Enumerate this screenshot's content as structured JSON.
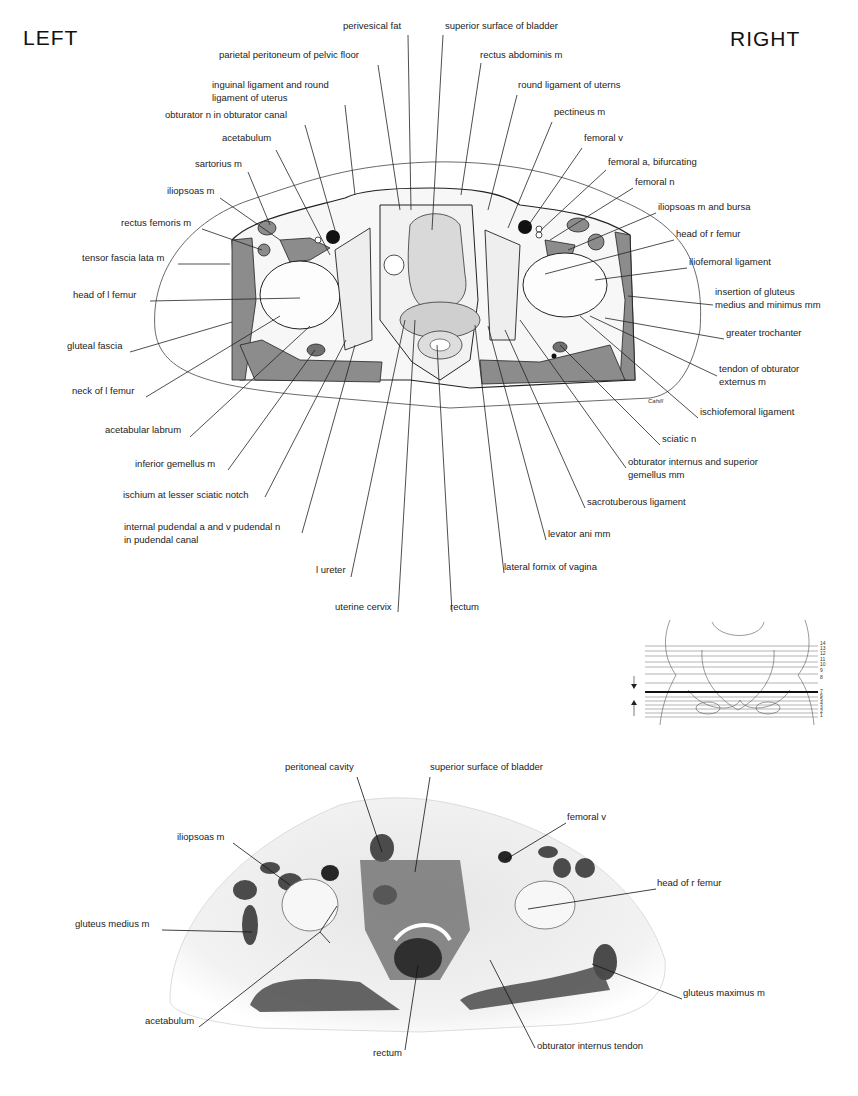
{
  "orientation": {
    "left": "LEFT",
    "right": "RIGHT"
  },
  "drawing": {
    "signature": "Cahill",
    "labels": [
      {
        "id": "perivesical-fat",
        "text": "perivesical fat",
        "x": 343,
        "y": 27
      },
      {
        "id": "superior-surface-bladder",
        "text": "superior surface of bladder",
        "x": 445,
        "y": 27
      },
      {
        "id": "parietal-peritoneum",
        "text": "parietal peritoneum of pelvic floor",
        "x": 219,
        "y": 56
      },
      {
        "id": "rectus-abdominis",
        "text": "rectus abdominis m",
        "x": 480,
        "y": 56
      },
      {
        "id": "inguinal-ligament",
        "text": "inguinal ligament and round\nligament of uterus",
        "x": 212,
        "y": 86
      },
      {
        "id": "round-ligament",
        "text": "round ligament of uterns",
        "x": 518,
        "y": 86
      },
      {
        "id": "obturator-n",
        "text": "obturator n in obturator canal",
        "x": 165,
        "y": 116
      },
      {
        "id": "pectineus",
        "text": "pectineus m",
        "x": 554,
        "y": 113
      },
      {
        "id": "acetabulum-top",
        "text": "acetabulum",
        "x": 222,
        "y": 139
      },
      {
        "id": "femoral-v-top",
        "text": "femoral v",
        "x": 584,
        "y": 139
      },
      {
        "id": "sartorius",
        "text": "sartorius m",
        "x": 195,
        "y": 165
      },
      {
        "id": "femoral-a",
        "text": "femoral a, bifurcating",
        "x": 608,
        "y": 163
      },
      {
        "id": "iliopsoas-left",
        "text": "iliopsoas m",
        "x": 167,
        "y": 192
      },
      {
        "id": "femoral-n",
        "text": "femoral n",
        "x": 635,
        "y": 183
      },
      {
        "id": "iliopsoas-bursa",
        "text": "iliopsoas m and bursa",
        "x": 658,
        "y": 208
      },
      {
        "id": "rectus-femoris",
        "text": "rectus femoris m",
        "x": 121,
        "y": 224
      },
      {
        "id": "head-r-femur-top",
        "text": "head of r femur",
        "x": 676,
        "y": 235
      },
      {
        "id": "tensor-fascia-lata",
        "text": "tensor fascia lata m",
        "x": 82,
        "y": 259
      },
      {
        "id": "iliofemoral-ligament",
        "text": "iliofemoral ligament",
        "x": 689,
        "y": 263
      },
      {
        "id": "head-l-femur",
        "text": "head of l femur",
        "x": 73,
        "y": 296
      },
      {
        "id": "insertion-gluteus",
        "text": "insertion of gluteus\nmedius and minimus mm",
        "x": 715,
        "y": 293
      },
      {
        "id": "greater-trochanter",
        "text": "greater trochanter",
        "x": 726,
        "y": 334
      },
      {
        "id": "gluteal-fascia",
        "text": "gluteal fascia",
        "x": 67,
        "y": 347
      },
      {
        "id": "tendon-obturator-externus",
        "text": "tendon of obturator\nexternus m",
        "x": 719,
        "y": 370
      },
      {
        "id": "neck-l-femur",
        "text": "neck of l femur",
        "x": 72,
        "y": 392
      },
      {
        "id": "ischiofemoral-ligament",
        "text": "ischiofemoral ligament",
        "x": 700,
        "y": 413
      },
      {
        "id": "acetabular-labrum",
        "text": "acetabular labrum",
        "x": 105,
        "y": 431
      },
      {
        "id": "sciatic-n",
        "text": "sciatic n",
        "x": 662,
        "y": 440
      },
      {
        "id": "inferior-gemellus",
        "text": "inferior gemellus m",
        "x": 135,
        "y": 465
      },
      {
        "id": "obturator-internus-superior-gemellus",
        "text": "obturator internus and superior\ngemellus mm",
        "x": 628,
        "y": 463
      },
      {
        "id": "ischium",
        "text": "ischium at lesser sciatic notch",
        "x": 123,
        "y": 496
      },
      {
        "id": "sacrotuberous-ligament",
        "text": "sacrotuberous ligament",
        "x": 587,
        "y": 503
      },
      {
        "id": "internal-pudendal",
        "text": "internal pudendal a and v pudendal n\nin pudendal canal",
        "x": 124,
        "y": 528
      },
      {
        "id": "levator-ani",
        "text": "levator ani mm",
        "x": 548,
        "y": 535
      },
      {
        "id": "lateral-fornix",
        "text": "lateral fornix of vagina",
        "x": 504,
        "y": 568
      },
      {
        "id": "l-ureter",
        "text": "l ureter",
        "x": 316,
        "y": 571
      },
      {
        "id": "uterine-cervix",
        "text": "uterine cervix",
        "x": 335,
        "y": 608
      },
      {
        "id": "rectum-top",
        "text": "rectum",
        "x": 450,
        "y": 608
      }
    ]
  },
  "reference_diagram": {
    "levels": [
      "14",
      "13",
      "12",
      "11",
      "10",
      "9",
      "8",
      "7",
      "6",
      "5",
      "4",
      "3",
      "2",
      "1"
    ],
    "selected_level": "7"
  },
  "photo": {
    "labels": [
      {
        "id": "peritoneal-cavity",
        "text": "peritoneal cavity",
        "x": 285,
        "y": 768
      },
      {
        "id": "superior-surface-bladder-photo",
        "text": "superior surface of bladder",
        "x": 430,
        "y": 768
      },
      {
        "id": "femoral-v-photo",
        "text": "femoral v",
        "x": 567,
        "y": 818
      },
      {
        "id": "iliopsoas-photo",
        "text": "iliopsoas m",
        "x": 177,
        "y": 838
      },
      {
        "id": "head-r-femur-photo",
        "text": "head of r femur",
        "x": 657,
        "y": 884
      },
      {
        "id": "gluteus-medius",
        "text": "gluteus medius m",
        "x": 75,
        "y": 925
      },
      {
        "id": "gluteus-maximus",
        "text": "gluteus maximus m",
        "x": 683,
        "y": 994
      },
      {
        "id": "acetabulum-photo",
        "text": "acetabulum",
        "x": 145,
        "y": 1022
      },
      {
        "id": "obturator-internus-tendon",
        "text": "obturator internus tendon",
        "x": 537,
        "y": 1047
      },
      {
        "id": "rectum-photo",
        "text": "rectum",
        "x": 373,
        "y": 1054
      }
    ]
  }
}
